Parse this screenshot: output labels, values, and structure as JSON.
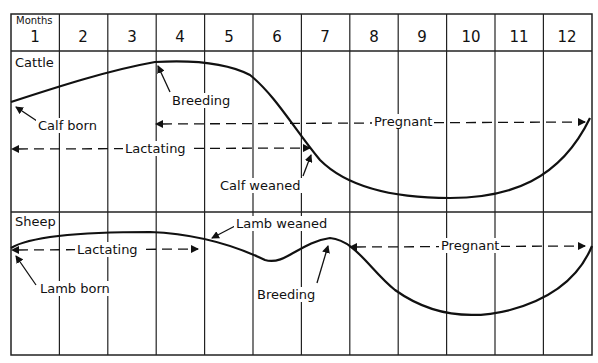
{
  "header": {
    "months_label": "Months",
    "months": [
      "1",
      "2",
      "3",
      "4",
      "5",
      "6",
      "7",
      "8",
      "9",
      "10",
      "11",
      "12"
    ]
  },
  "sections": {
    "cattle": {
      "title": "Cattle",
      "annotations": {
        "calf_born": "Calf born",
        "breeding": "Breeding",
        "pregnant": "Pregnant",
        "lactating": "Lactating",
        "calf_weaned": "Calf weaned"
      }
    },
    "sheep": {
      "title": "Sheep",
      "annotations": {
        "lactating": "Lactating",
        "lamb_weaned": "Lamb weaned",
        "pregnant": "Pregnant",
        "lamb_born": "Lamb born",
        "breeding": "Breeding"
      }
    }
  },
  "colors": {
    "line": "#111111",
    "grid": "#222222",
    "background": "#ffffff"
  }
}
